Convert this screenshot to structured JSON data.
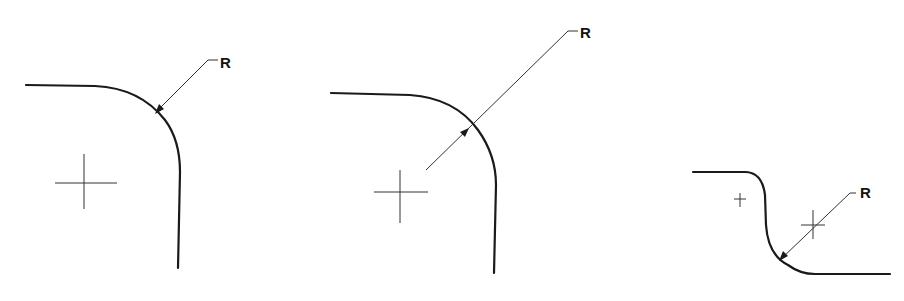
{
  "figures": [
    {
      "id": "fig-1",
      "description": "Radius dimension with leader arrow outside the arc, pointing inward",
      "label": "R"
    },
    {
      "id": "fig-2",
      "description": "Radius dimension line crossing the arc, arrow on the inside toward arc",
      "label": "R"
    },
    {
      "id": "fig-3",
      "description": "Reverse (S-curve) fillet with radius dimension from offset center",
      "label": "R"
    }
  ]
}
